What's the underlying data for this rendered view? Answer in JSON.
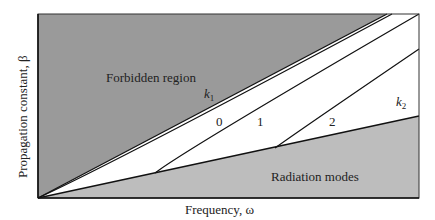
{
  "diagram": {
    "xlabel": "Frequency, ω",
    "ylabel": "Propagation constant, β",
    "regions": {
      "forbidden": "Forbidden region",
      "radiation": "Radiation modes"
    },
    "line_labels": {
      "k1": "k",
      "k1_sub": "1",
      "k2": "k",
      "k2_sub": "2"
    },
    "mode_labels": [
      "0",
      "1",
      "2"
    ],
    "colors": {
      "forbidden_fill": "#9a9a9a",
      "radiation_fill": "#bdbdbd",
      "guided_fill": "#ffffff",
      "line": "#111111",
      "text": "#222222"
    }
  }
}
